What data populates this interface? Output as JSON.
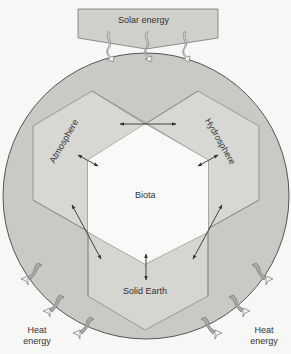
{
  "diagram": {
    "source": {
      "label": "Solar energy"
    },
    "sphere": {
      "components": [
        {
          "id": "atmosphere",
          "label": "Atmosphere"
        },
        {
          "id": "hydrosphere",
          "label": "Hydrosphere"
        },
        {
          "id": "biota",
          "label": "Biota"
        },
        {
          "id": "solid-earth",
          "label": "Solid Earth"
        }
      ]
    },
    "outputs": {
      "left": {
        "line1": "Heat",
        "line2": "energy"
      },
      "right": {
        "line1": "Heat",
        "line2": "energy"
      }
    },
    "connections": [
      {
        "from": "Atmosphere",
        "to": "Hydrosphere",
        "type": "bidirectional"
      },
      {
        "from": "Atmosphere",
        "to": "Biota",
        "type": "bidirectional"
      },
      {
        "from": "Hydrosphere",
        "to": "Biota",
        "type": "bidirectional"
      },
      {
        "from": "Atmosphere",
        "to": "Solid Earth",
        "type": "bidirectional"
      },
      {
        "from": "Hydrosphere",
        "to": "Solid Earth",
        "type": "bidirectional"
      },
      {
        "from": "Biota",
        "to": "Solid Earth",
        "type": "bidirectional"
      },
      {
        "from": "Solar energy",
        "to": "Earth system",
        "type": "input",
        "count": 3
      },
      {
        "from": "Earth system",
        "to": "Heat energy",
        "type": "output",
        "count": 6
      }
    ],
    "colors": {
      "background": "#f7f7f5",
      "sphere_fill": "#c9c9c6",
      "hexagon_fill": "#d8d8d5",
      "biota_fill": "#f9f9f7",
      "line": "#6e6e6c",
      "arrow": "#333333",
      "solar_box": "#cfcfcc"
    }
  }
}
